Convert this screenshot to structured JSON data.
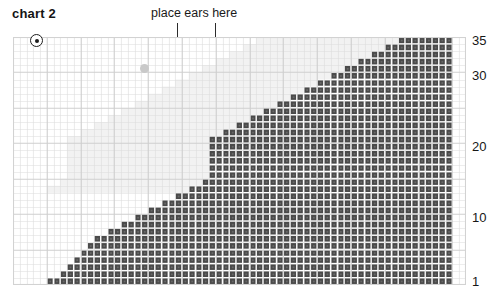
{
  "title": "chart 2",
  "annotation": {
    "text": "place ears here",
    "tick_left_label": "ear-marker-left",
    "tick_right_label": "ear-marker-right"
  },
  "axis": {
    "row_numbers": [
      {
        "label": "35",
        "row": 35
      },
      {
        "label": "30",
        "row": 30
      },
      {
        "label": "20",
        "row": 20
      },
      {
        "label": "10",
        "row": 10
      },
      {
        "label": "1",
        "row": 1
      }
    ]
  },
  "symbols": [
    {
      "name": "bullseye-symbol",
      "kind": "bullseye",
      "col": 4,
      "row": 35
    },
    {
      "name": "gray-dot-symbol",
      "kind": "dot-gray",
      "col": 20,
      "row": 31
    }
  ],
  "colors": {
    "filled": "#4a4a4a",
    "empty": "#ffffff",
    "empty_shade": "#f2f2f2",
    "gridline": "#dcdcdc",
    "gridline_major": "#cfcfcf",
    "text": "#171717",
    "tick": "#2b2b2b"
  },
  "chart_data": {
    "type": "heatmap",
    "title": "chart 2",
    "xlabel": "",
    "ylabel": "",
    "cols": 67,
    "rows": 35,
    "row_tick_labels": [
      "1",
      "10",
      "20",
      "30",
      "35"
    ],
    "legend": [
      {
        "symbol": "filled-cell",
        "color": "#4a4a4a",
        "meaning": "worked stitch"
      },
      {
        "symbol": "empty-cell",
        "color": "#ffffff",
        "meaning": "no stitch"
      },
      {
        "symbol": "bullseye",
        "meaning": "start point marker"
      },
      {
        "symbol": "gray-dot",
        "meaning": "placement marker"
      }
    ],
    "annotations": [
      {
        "text": "place ears here",
        "ticks_at_cols": [
          24,
          30
        ]
      }
    ],
    "row_fill_start_col": [
      58,
      56,
      54,
      52,
      50,
      48,
      46,
      44,
      42,
      40,
      38,
      36,
      34,
      32,
      30,
      30,
      30,
      30,
      30,
      30,
      29,
      27,
      25,
      23,
      21,
      19,
      17,
      15,
      13,
      12,
      11,
      10,
      9,
      8,
      6
    ],
    "row_fill_end_col": 65,
    "empty_shade_region": {
      "description": "light gray shading fills the staircase void above/left of the filled region in the upper portion of the chart",
      "top_row": 35,
      "bottom_row": 14
    }
  }
}
